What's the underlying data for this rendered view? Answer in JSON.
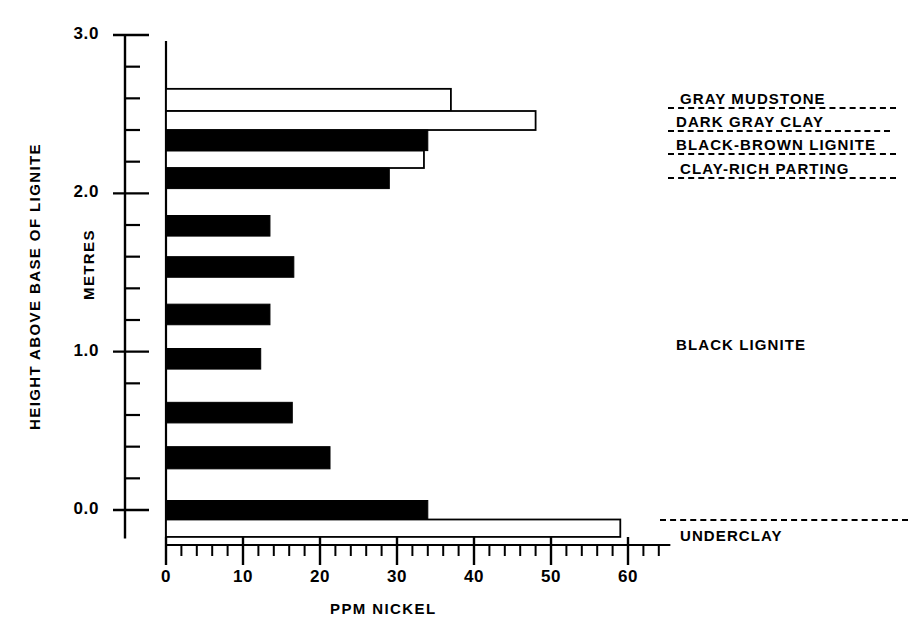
{
  "chart_data": {
    "type": "bar",
    "orientation": "horizontal",
    "title": "",
    "xlabel": "PPM NICKEL",
    "ylabel": "HEIGHT ABOVE BASE OF LIGNITE",
    "ylabel_units": "METRES",
    "xlim": [
      0,
      65
    ],
    "ylim": [
      -0.2,
      3.0
    ],
    "grid": false,
    "legend": false,
    "x_ticks_major": [
      0,
      10,
      20,
      30,
      40,
      50,
      60
    ],
    "x_tick_labels": [
      "0",
      "10",
      "20",
      "30",
      "40",
      "50",
      "60"
    ],
    "x_minor_step": 2,
    "y_ticks_major": [
      0.0,
      1.0,
      2.0,
      3.0
    ],
    "y_tick_labels": [
      "0.0",
      "1.0",
      "2.0",
      "3.0"
    ],
    "y_minor_step": 0.2,
    "bar_fill_black": "#000000",
    "bar_fill_white": "#ffffff",
    "bar_stroke": "#000000",
    "samples": [
      {
        "height_top": 2.66,
        "height_bottom": 2.52,
        "value": 37,
        "fill": "white",
        "unit": "GRAY MUDSTONE"
      },
      {
        "height_top": 2.52,
        "height_bottom": 2.4,
        "value": 48,
        "fill": "white",
        "unit": "DARK GRAY CLAY"
      },
      {
        "height_top": 2.4,
        "height_bottom": 2.27,
        "value": 34,
        "fill": "black",
        "unit": "BLACK-BROWN LIGNITE"
      },
      {
        "height_top": 2.27,
        "height_bottom": 2.16,
        "value": 33.5,
        "fill": "white",
        "unit": "CLAY-RICH PARTING"
      },
      {
        "height_top": 2.16,
        "height_bottom": 2.03,
        "value": 29,
        "fill": "black",
        "unit": "BLACK LIGNITE"
      },
      {
        "height_top": 1.86,
        "height_bottom": 1.73,
        "value": 13.5,
        "fill": "black",
        "unit": "BLACK LIGNITE"
      },
      {
        "height_top": 1.6,
        "height_bottom": 1.47,
        "value": 16.6,
        "fill": "black",
        "unit": "BLACK LIGNITE"
      },
      {
        "height_top": 1.3,
        "height_bottom": 1.17,
        "value": 13.5,
        "fill": "black",
        "unit": "BLACK LIGNITE"
      },
      {
        "height_top": 1.02,
        "height_bottom": 0.89,
        "value": 12.3,
        "fill": "black",
        "unit": "BLACK LIGNITE"
      },
      {
        "height_top": 0.68,
        "height_bottom": 0.55,
        "value": 16.4,
        "fill": "black",
        "unit": "BLACK LIGNITE"
      },
      {
        "height_top": 0.4,
        "height_bottom": 0.26,
        "value": 21.3,
        "fill": "black",
        "unit": "BLACK LIGNITE"
      },
      {
        "height_top": 0.06,
        "height_bottom": -0.06,
        "value": 34,
        "fill": "black",
        "unit": "BLACK LIGNITE"
      },
      {
        "height_top": -0.06,
        "height_bottom": -0.17,
        "value": 59,
        "fill": "white",
        "unit": "UNDERCLAY"
      }
    ]
  },
  "annotations": {
    "strat_labels": [
      {
        "text": "GRAY MUDSTONE",
        "underline": "dashed"
      },
      {
        "text": "DARK GRAY CLAY",
        "underline": "dashed"
      },
      {
        "text": "BLACK-BROWN LIGNITE",
        "underline": "dashed"
      },
      {
        "text": "CLAY-RICH PARTING",
        "underline": "dashed"
      }
    ],
    "black_lignite_label": "BLACK LIGNITE",
    "underclay_label": "UNDERCLAY"
  }
}
